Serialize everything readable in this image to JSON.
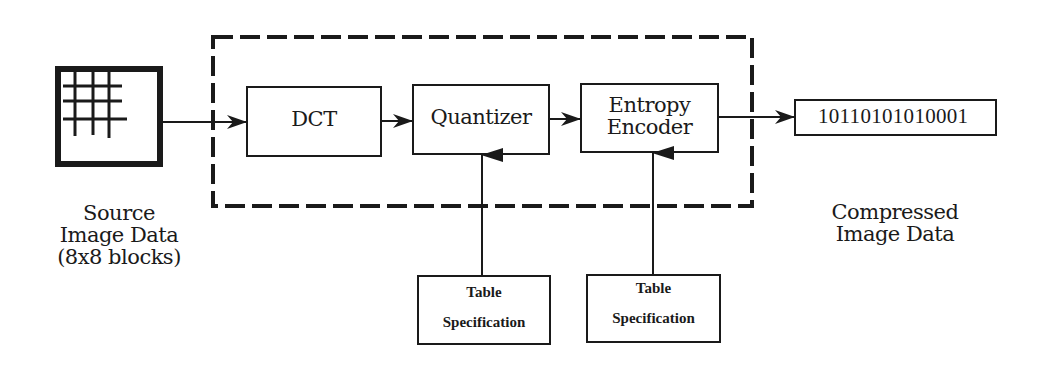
{
  "diagram": {
    "source": {
      "label_lines": [
        "Source",
        "Image Data",
        "(8x8 blocks)"
      ],
      "icon": "grid-image-icon"
    },
    "encoder_boundary": {
      "style": "dashed"
    },
    "blocks": [
      {
        "id": "dct",
        "label_lines": [
          "DCT"
        ]
      },
      {
        "id": "quantizer",
        "label_lines": [
          "Quantizer"
        ]
      },
      {
        "id": "entropy_encoder",
        "label_lines": [
          "Entropy",
          "Encoder"
        ]
      }
    ],
    "output": {
      "bitstream": "10110101010001",
      "label_lines": [
        "Compressed",
        "Image Data"
      ]
    },
    "table_specs": [
      {
        "feeds": "quantizer",
        "label_lines": [
          "Table",
          "Specification"
        ]
      },
      {
        "feeds": "entropy_encoder",
        "label_lines": [
          "Table",
          "Specification"
        ]
      }
    ],
    "edges": [
      [
        "source",
        "dct"
      ],
      [
        "dct",
        "quantizer"
      ],
      [
        "quantizer",
        "entropy_encoder"
      ],
      [
        "entropy_encoder",
        "output"
      ],
      [
        "table_spec_1",
        "quantizer"
      ],
      [
        "table_spec_2",
        "entropy_encoder"
      ]
    ],
    "colors": {
      "ink": "#1a1a1a",
      "background": "#ffffff"
    }
  }
}
